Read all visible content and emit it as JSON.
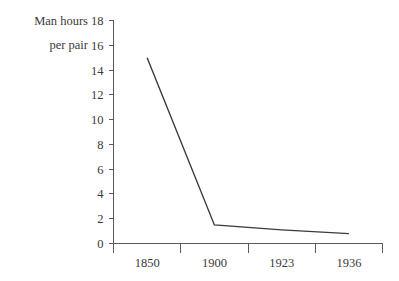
{
  "chart_data": {
    "type": "line",
    "title": "",
    "subtitle": "",
    "xlabel": "",
    "ylabel": "Man hours per pair",
    "ylabel_lines": [
      "Man hours",
      "per pair"
    ],
    "categories": [
      "1850",
      "1900",
      "1923",
      "1936"
    ],
    "values": [
      15.0,
      1.5,
      1.1,
      0.8
    ],
    "series": [
      {
        "name": "Man hours per pair",
        "values": [
          15.0,
          1.5,
          1.1,
          0.8
        ],
        "color": "#3b3b3b"
      }
    ],
    "ylim": [
      0,
      18
    ],
    "yticks": [
      0,
      2,
      4,
      6,
      8,
      10,
      12,
      14,
      16,
      18
    ],
    "ytick_labels": [
      "0",
      "2",
      "4",
      "6",
      "8",
      "10",
      "12",
      "14",
      "16",
      "18"
    ],
    "xtick_labels": [
      "1850",
      "1900",
      "1923",
      "1936"
    ],
    "grid": false,
    "legend": false,
    "legend_position": "none",
    "axis_color": "#5a5a5a",
    "background_color": "#ffffff",
    "text_color": "#3a3a3a"
  }
}
